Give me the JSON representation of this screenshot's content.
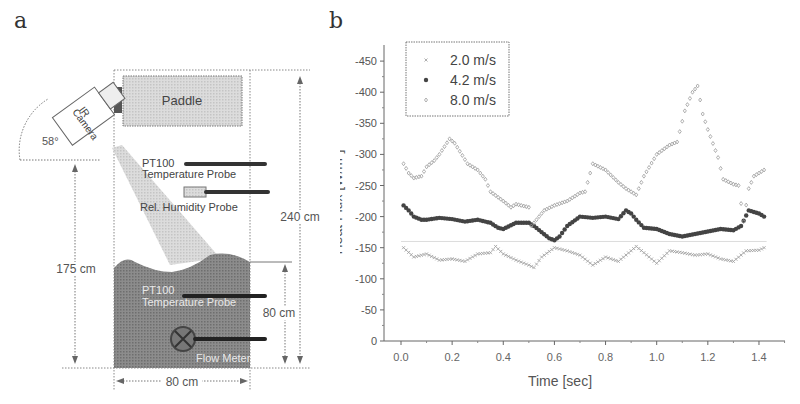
{
  "panels": {
    "a_label": "a",
    "b_label": "b"
  },
  "diagram": {
    "paddle_label": "Paddle",
    "camera_label_line1": "IR",
    "camera_label_line2": "Camera",
    "angle_label": "58°",
    "probe1_line1": "PT100",
    "probe1_line2": "Temperature Probe",
    "humidity_label": "Rel. Humidity Probe",
    "height_total": "240 cm",
    "height_camera": "175 cm",
    "water_depth": "80 cm",
    "tank_width": "80 cm",
    "probe2_line1": "PT100",
    "probe2_line2": "Temperature Probe",
    "flowmeter_label": "Flow Meter",
    "colors": {
      "water": "#8a8a8a",
      "paddle": "#d9d9d9",
      "beam": "#cfcfcf",
      "probe": "#333333"
    }
  },
  "chart_data": {
    "type": "scatter",
    "title": "",
    "xlabel": "Time [sec]",
    "ylabel": "Heat Flux [W/m²]",
    "xlim": [
      -0.05,
      1.5
    ],
    "ylim": [
      0,
      -475
    ],
    "x_ticks": [
      "0.0",
      "0.2",
      "0.4",
      "0.6",
      "0.8",
      "1.0",
      "1.2",
      "1.4"
    ],
    "y_ticks": [
      "-450",
      "-400",
      "-350",
      "-300",
      "-250",
      "-200",
      "-150",
      "-100",
      "-50",
      "0"
    ],
    "grid": false,
    "legend_position": "upper-left",
    "reference_line_y": -160,
    "series": [
      {
        "name": "2.0 m/s",
        "marker": "x",
        "color": "#9a9a9a",
        "x": [
          0.01,
          0.05,
          0.1,
          0.15,
          0.2,
          0.25,
          0.3,
          0.35,
          0.37,
          0.4,
          0.45,
          0.5,
          0.52,
          0.55,
          0.6,
          0.65,
          0.7,
          0.75,
          0.8,
          0.85,
          0.9,
          0.92,
          0.95,
          1.0,
          1.05,
          1.1,
          1.15,
          1.2,
          1.25,
          1.3,
          1.35,
          1.4,
          1.42
        ],
        "y": [
          -150,
          -135,
          -140,
          -130,
          -132,
          -128,
          -140,
          -142,
          -152,
          -140,
          -130,
          -122,
          -118,
          -135,
          -150,
          -145,
          -138,
          -122,
          -135,
          -128,
          -145,
          -152,
          -142,
          -125,
          -145,
          -142,
          -138,
          -140,
          -132,
          -128,
          -145,
          -146,
          -150
        ]
      },
      {
        "name": "4.2 m/s",
        "marker": "o",
        "color": "#444444",
        "x": [
          0.01,
          0.03,
          0.05,
          0.08,
          0.1,
          0.15,
          0.2,
          0.25,
          0.3,
          0.35,
          0.38,
          0.4,
          0.45,
          0.5,
          0.52,
          0.55,
          0.58,
          0.6,
          0.62,
          0.65,
          0.7,
          0.75,
          0.8,
          0.85,
          0.88,
          0.9,
          0.92,
          0.95,
          1.0,
          1.05,
          1.1,
          1.15,
          1.2,
          1.25,
          1.3,
          1.33,
          1.36,
          1.4,
          1.42
        ],
        "y": [
          -218,
          -210,
          -200,
          -195,
          -195,
          -198,
          -196,
          -192,
          -195,
          -190,
          -182,
          -180,
          -190,
          -190,
          -185,
          -175,
          -165,
          -162,
          -168,
          -185,
          -200,
          -198,
          -200,
          -196,
          -210,
          -205,
          -195,
          -182,
          -180,
          -172,
          -168,
          -172,
          -176,
          -180,
          -178,
          -185,
          -210,
          -205,
          -200
        ]
      },
      {
        "name": "8.0 m/s",
        "marker": "diamond",
        "color": "#9a9a9a",
        "x": [
          0.01,
          0.03,
          0.05,
          0.08,
          0.1,
          0.13,
          0.15,
          0.19,
          0.21,
          0.23,
          0.26,
          0.3,
          0.33,
          0.35,
          0.4,
          0.43,
          0.45,
          0.5,
          0.51,
          0.53,
          0.56,
          0.6,
          0.65,
          0.7,
          0.72,
          0.75,
          0.8,
          0.85,
          0.88,
          0.9,
          0.92,
          0.95,
          1.0,
          1.05,
          1.08,
          1.11,
          1.14,
          1.16,
          1.18,
          1.2,
          1.24,
          1.26,
          1.3,
          1.32,
          1.34,
          1.36,
          1.38,
          1.42
        ],
        "y": [
          -285,
          -270,
          -262,
          -265,
          -280,
          -290,
          -300,
          -325,
          -318,
          -305,
          -285,
          -275,
          -260,
          -240,
          -225,
          -215,
          -220,
          -215,
          -185,
          -195,
          -210,
          -218,
          -225,
          -238,
          -240,
          -285,
          -275,
          -255,
          -245,
          -240,
          -235,
          -265,
          -300,
          -315,
          -320,
          -370,
          -400,
          -410,
          -365,
          -340,
          -295,
          -260,
          -252,
          -250,
          -192,
          -245,
          -265,
          -275
        ]
      }
    ]
  }
}
